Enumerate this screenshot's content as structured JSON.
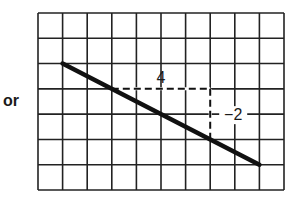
{
  "prefix_text": "or",
  "grid": {
    "columns": 10,
    "rows": 7,
    "left": 38,
    "top": 13,
    "right": 284,
    "bottom": 190,
    "line_color": "#222222"
  },
  "line": {
    "start_grid": [
      1,
      2
    ],
    "end_grid": [
      9,
      6
    ],
    "slope": "-2/4",
    "color": "#111111"
  },
  "run": {
    "label": "4",
    "from_grid": [
      3,
      3
    ],
    "to_grid": [
      7,
      3
    ]
  },
  "rise": {
    "label": "−2",
    "from_grid": [
      7,
      3
    ],
    "to_grid": [
      7,
      5
    ]
  },
  "chart_data": {
    "type": "line",
    "title": "",
    "xlabel": "",
    "ylabel": "",
    "grid": true,
    "series": [
      {
        "name": "line",
        "x": [
          1,
          3,
          7,
          9
        ],
        "y": [
          5,
          4,
          2,
          1
        ]
      }
    ],
    "annotations": [
      {
        "text": "4",
        "meaning": "run (horizontal change)"
      },
      {
        "text": "−2",
        "meaning": "rise (vertical change)"
      }
    ],
    "slope": -0.5
  }
}
